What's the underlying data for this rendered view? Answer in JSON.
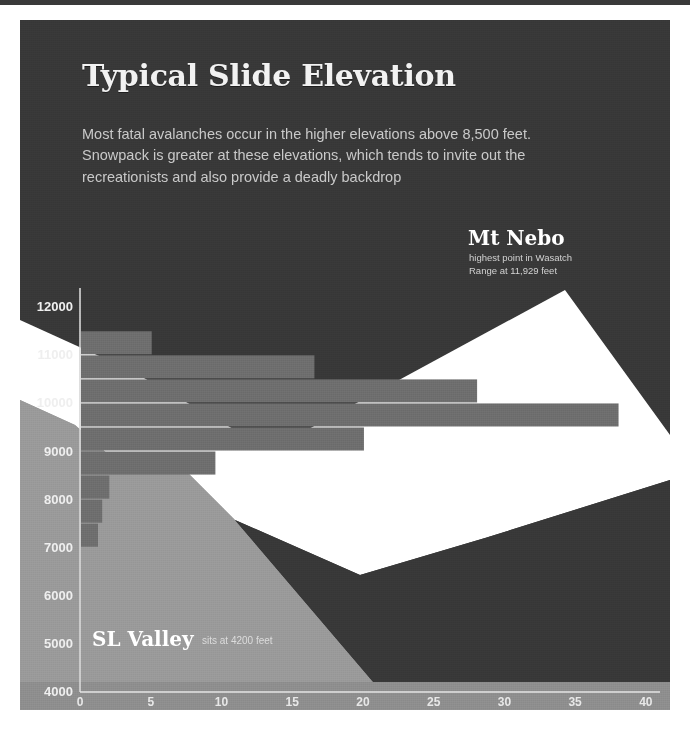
{
  "poster": {
    "title": "Typical Slide Elevation",
    "deck": "Most fatal avalanches occur in the higher elevations above 8,500 feet. Snowpack is greater at these elevations, which tends to invite out the recreationists and also provide a deadly backdrop",
    "bg_color": "#383838",
    "title_color": "#f2f2f2",
    "deck_color": "#c9c9c9"
  },
  "annotations": {
    "peak": {
      "title": "Mt Nebo",
      "line1": "highest point in Wasatch",
      "line2": "Range at 11,929 feet"
    },
    "valley": {
      "title": "SL Valley",
      "sub": "sits at 4200 feet"
    }
  },
  "chart_data": {
    "type": "bar",
    "orientation": "horizontal",
    "title": "Typical Slide Elevation",
    "xlabel": "",
    "ylabel": "",
    "xlim": [
      0,
      41
    ],
    "ylim": [
      4000,
      12400
    ],
    "grid": false,
    "xticks": [
      0,
      5,
      10,
      15,
      20,
      25,
      30,
      35,
      40
    ],
    "yticks": [
      4000,
      5000,
      6000,
      7000,
      8000,
      9000,
      10000,
      11000,
      12000
    ],
    "bar_color": "#6e6e6e",
    "categories": [
      11000,
      10500,
      10000,
      9500,
      9000,
      8500,
      8000,
      7500,
      7000
    ],
    "values": [
      5,
      16.5,
      28,
      38,
      20,
      9.5,
      2,
      1.5,
      1.2
    ],
    "series": [
      {
        "name": "Avalanche fatalities by elevation band",
        "values": [
          5,
          16.5,
          28,
          38,
          20,
          9.5,
          2,
          1.5,
          1.2
        ]
      }
    ],
    "terrain": {
      "snow_color": "#ffffff",
      "foreground_color": "#9a9a9a",
      "peak_elevation": 11929,
      "valley_elevation": 4200
    }
  },
  "colors": {
    "accent_snow": "#ffffff",
    "terrain_gray": "#9a9a9a",
    "bar_gray": "#6e6e6e",
    "background": "#383838",
    "axis": "#d8d8d8"
  }
}
